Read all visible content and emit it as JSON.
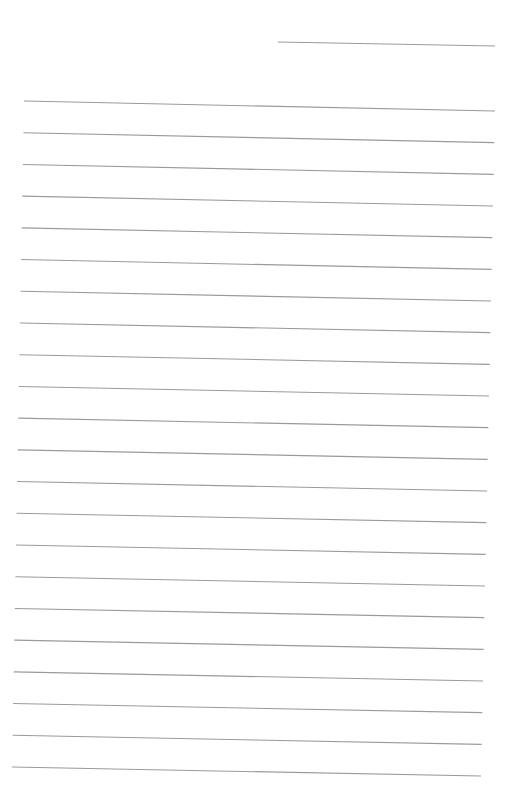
{
  "page": {
    "type": "lined-paper",
    "background_color": "#ffffff",
    "line_color": "#9a9a9a",
    "line_width": 1.1,
    "header_line": {
      "x1": 278,
      "y1": 42,
      "x2": 495,
      "y2": 46
    },
    "ruled_lines": {
      "count": 22,
      "first": {
        "x1": 24,
        "y1": 101,
        "x2": 495,
        "y2": 111
      },
      "last": {
        "x1": 12,
        "y1": 767,
        "x2": 481,
        "y2": 776
      }
    }
  }
}
